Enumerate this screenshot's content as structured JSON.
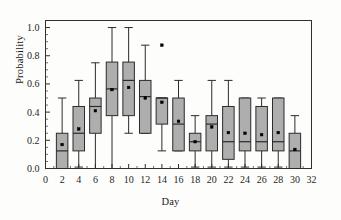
{
  "chart_data": {
    "type": "box",
    "title": "",
    "xlabel": "Day",
    "ylabel": "Probability",
    "xlim": [
      0,
      32
    ],
    "ylim": [
      0.0,
      1.05
    ],
    "xticks": [
      0,
      2,
      4,
      6,
      8,
      10,
      12,
      14,
      16,
      18,
      20,
      22,
      24,
      26,
      28,
      30,
      32
    ],
    "xtick_labels": [
      "0",
      "2",
      "4",
      "6",
      "8",
      "10",
      "12",
      "14",
      "16",
      "18",
      "20",
      "22",
      "24",
      "26",
      "28",
      "30",
      "32"
    ],
    "yticks": [
      0.0,
      0.2,
      0.4,
      0.6,
      0.8,
      1.0
    ],
    "ytick_labels": [
      "0.0",
      "0.2",
      "0.4",
      "0.6",
      "0.8",
      "1.0"
    ],
    "grid": false,
    "legend": null,
    "box_fill_color": "#aeaeae",
    "box_edge_color": "#2b2b2b",
    "mean_marker": "square",
    "mean_marker_color": "#000000",
    "categories": [
      "2",
      "4",
      "6",
      "8",
      "10",
      "12",
      "14",
      "16",
      "18",
      "20",
      "22",
      "24",
      "26",
      "28",
      "30"
    ],
    "boxes": [
      {
        "day": 2,
        "whisker_low": 0.0,
        "q1": 0.0,
        "median": 0.125,
        "q3": 0.25,
        "whisker_high": 0.5,
        "mean": 0.17,
        "outliers": []
      },
      {
        "day": 4,
        "whisker_low": 0.01,
        "q1": 0.125,
        "median": 0.25,
        "q3": 0.44,
        "whisker_high": 0.625,
        "mean": 0.28,
        "outliers": []
      },
      {
        "day": 6,
        "whisker_low": 0.0,
        "q1": 0.25,
        "median": 0.44,
        "q3": 0.5,
        "whisker_high": 0.75,
        "mean": 0.41,
        "outliers": []
      },
      {
        "day": 8,
        "whisker_low": 0.0,
        "q1": 0.375,
        "median": 0.565,
        "q3": 0.755,
        "whisker_high": 1.0,
        "mean": 0.56,
        "outliers": []
      },
      {
        "day": 10,
        "whisker_low": 0.25,
        "q1": 0.375,
        "median": 0.625,
        "q3": 0.755,
        "whisker_high": 1.0,
        "mean": 0.575,
        "outliers": []
      },
      {
        "day": 12,
        "whisker_low": 0.25,
        "q1": 0.25,
        "median": 0.51,
        "q3": 0.625,
        "whisker_high": 0.875,
        "mean": 0.5,
        "outliers": []
      },
      {
        "day": 14,
        "whisker_low": 0.125,
        "q1": 0.315,
        "median": 0.5,
        "q3": 0.5,
        "whisker_high": 0.5,
        "mean": 0.47,
        "outliers": [
          0.875
        ]
      },
      {
        "day": 16,
        "whisker_low": 0.125,
        "q1": 0.125,
        "median": 0.315,
        "q3": 0.5,
        "whisker_high": 0.625,
        "mean": 0.335,
        "outliers": []
      },
      {
        "day": 18,
        "whisker_low": 0.01,
        "q1": 0.125,
        "median": 0.19,
        "q3": 0.25,
        "whisker_high": 0.375,
        "mean": 0.19,
        "outliers": []
      },
      {
        "day": 20,
        "whisker_low": 0.01,
        "q1": 0.125,
        "median": 0.315,
        "q3": 0.375,
        "whisker_high": 0.625,
        "mean": 0.295,
        "outliers": []
      },
      {
        "day": 22,
        "whisker_low": 0.01,
        "q1": 0.065,
        "median": 0.19,
        "q3": 0.44,
        "whisker_high": 0.625,
        "mean": 0.255,
        "outliers": []
      },
      {
        "day": 24,
        "whisker_low": 0.01,
        "q1": 0.125,
        "median": 0.19,
        "q3": 0.5,
        "whisker_high": 0.5,
        "mean": 0.25,
        "outliers": []
      },
      {
        "day": 26,
        "whisker_low": 0.01,
        "q1": 0.125,
        "median": 0.19,
        "q3": 0.44,
        "whisker_high": 0.5,
        "mean": 0.24,
        "outliers": []
      },
      {
        "day": 28,
        "whisker_low": 0.01,
        "q1": 0.125,
        "median": 0.19,
        "q3": 0.5,
        "whisker_high": 0.5,
        "mean": 0.255,
        "outliers": []
      },
      {
        "day": 30,
        "whisker_low": 0.0,
        "q1": 0.0,
        "median": 0.125,
        "q3": 0.25,
        "whisker_high": 0.375,
        "mean": 0.135,
        "outliers": []
      }
    ]
  }
}
